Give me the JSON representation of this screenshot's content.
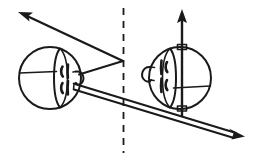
{
  "figure": {
    "title": "Two spherical head figures facing each other across a dashed symmetry line",
    "domain_label": "line-drawing diagram",
    "background_color": "#ffffff",
    "stroke_color": "#1a1a1a",
    "width": 255,
    "height": 162,
    "labels": {
      "left_head": "left head sphere",
      "right_head": "right head sphere",
      "mirror_line": "dashed vertical mirror line",
      "upper_arrow": "upper-left direction arrow",
      "lower_arrow": "lower-right direction arrow",
      "vertical_arrow": "vertical up arrow through right head"
    },
    "elements": [
      {
        "name": "left-head",
        "type": "sphere",
        "center_x": 50,
        "center_y": 78,
        "radius": 31,
        "facing": "right",
        "eye_count": 2,
        "ear_side": "right"
      },
      {
        "name": "right-head",
        "type": "sphere",
        "center_x": 180,
        "center_y": 78,
        "radius": 31,
        "facing": "left",
        "eye_count": 2,
        "ear_side": "left"
      },
      {
        "name": "mirror-line",
        "type": "dashed-line",
        "x": 123,
        "y_start": 8,
        "y_end": 153
      },
      {
        "name": "upper-left-arrow",
        "type": "arrow",
        "from_x": 122,
        "from_y": 61,
        "to_x": 21,
        "to_y": 13
      },
      {
        "name": "lower-right-arrow",
        "type": "arrow",
        "from_x": 74,
        "from_y": 86,
        "to_x": 240,
        "to_y": 136
      },
      {
        "name": "vertical-up-arrow",
        "type": "arrow",
        "from_x": 182,
        "from_y": 114,
        "to_x": 182,
        "to_y": 11
      }
    ],
    "annotations": {
      "top_marker": "small rectangular tick at top of right sphere axis",
      "bottom_marker": "small rectangular tick at bottom of right sphere axis"
    }
  }
}
